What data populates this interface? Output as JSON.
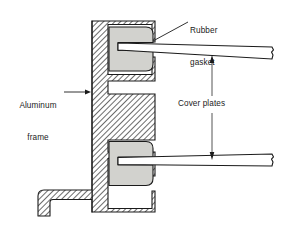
{
  "figure": {
    "type": "technical-cross-section",
    "background_color": "#ffffff",
    "line_color": "#1b1b1b",
    "hatch_color": "#404040",
    "gasket_fill": "#d2d2ce",
    "plate_fill": "#ffffff"
  },
  "labels": {
    "rubber_gasket": {
      "line1": "Rubber",
      "line2": "gasket"
    },
    "aluminum_frame": {
      "line1": "Aluminum",
      "line2": "frame"
    },
    "cover_plates": {
      "text": "Cover plates"
    }
  },
  "parts": [
    {
      "id": "aluminum-frame",
      "name": "Aluminum frame",
      "fill": "hatched",
      "note": "E-shaped extrusion with vertical spine, two horizontal arms and a bottom foot"
    },
    {
      "id": "rubber-gasket-upper",
      "name": "Rubber gasket (upper)",
      "fill": "#d2d2ce"
    },
    {
      "id": "rubber-gasket-lower",
      "name": "Rubber gasket (lower)",
      "fill": "#d2d2ce"
    },
    {
      "id": "cover-plate-upper",
      "name": "Cover plate (upper)",
      "fill": "#ffffff"
    },
    {
      "id": "cover-plate-lower",
      "name": "Cover plate (lower)",
      "fill": "#ffffff"
    }
  ],
  "leaders": [
    {
      "id": "leader-rubber-gasket",
      "from_label": "Rubber gasket",
      "style": "plain-line",
      "points": "188,22 to 152,41"
    },
    {
      "id": "leader-aluminum-frame",
      "from_label": "Aluminum frame",
      "style": "single-arrow",
      "points": "66,92 to 88,92"
    }
  ],
  "dimension": {
    "id": "cover-plates-dimension",
    "style": "double-arrow-vertical",
    "x": 212,
    "y_top": 59,
    "y_bottom": 166,
    "label": "Cover plates"
  }
}
